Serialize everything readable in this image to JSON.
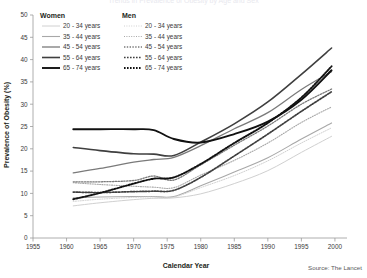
{
  "figure": {
    "cut_title": "Trends in Prevalence of Obesity by Age and Sex",
    "source_note": "Source: The Lancet"
  },
  "axes": {
    "xlabel": "Calendar Year",
    "ylabel": "Prevalence of Obesity (%)",
    "xticks": [
      1955,
      1960,
      1965,
      1970,
      1975,
      1980,
      1985,
      1990,
      1995,
      2000
    ],
    "yticks": [
      0,
      5,
      10,
      15,
      20,
      25,
      30,
      35,
      40,
      45,
      50
    ],
    "xlim": [
      1955,
      2001.5
    ],
    "ylim": [
      0,
      50
    ],
    "grid": false
  },
  "legend": {
    "position": "top-left-inside",
    "groups": [
      {
        "title": "Women",
        "entries": [
          {
            "label": "20 - 34 years",
            "color": "#d0d0d0",
            "width": 1.0,
            "dash": "none"
          },
          {
            "label": "35 - 44 years",
            "color": "#a8a8a8",
            "width": 1.1,
            "dash": "none"
          },
          {
            "label": "45 - 54 years",
            "color": "#7a7a7a",
            "width": 1.3,
            "dash": "none"
          },
          {
            "label": "55 - 64 years",
            "color": "#3f3f3f",
            "width": 1.6,
            "dash": "none"
          },
          {
            "label": "65 - 74 years",
            "color": "#111111",
            "width": 1.9,
            "dash": "none"
          }
        ]
      },
      {
        "title": "Men",
        "entries": [
          {
            "label": "20 - 34 years",
            "color": "#d0d0d0",
            "width": 1.0,
            "dash": "1,1.4"
          },
          {
            "label": "35 - 44 years",
            "color": "#a8a8a8",
            "width": 1.1,
            "dash": "1,1.4"
          },
          {
            "label": "45 - 54 years",
            "color": "#7a7a7a",
            "width": 1.3,
            "dash": "1.4,1.4"
          },
          {
            "label": "55 - 64 years",
            "color": "#3f3f3f",
            "width": 1.7,
            "dash": "1.6,1.4"
          },
          {
            "label": "65 - 74 years",
            "color": "#111111",
            "width": 1.9,
            "dash": "1.6,1.4"
          }
        ]
      }
    ]
  },
  "chart_data": {
    "type": "line",
    "title": "Trends in Prevalence of Obesity by Age and Sex",
    "xlabel": "Calendar Year",
    "ylabel": "Prevalence of Obesity (%)",
    "xlim": [
      1955,
      2001.5
    ],
    "ylim": [
      0,
      50
    ],
    "x": [
      1961,
      1965,
      1970,
      1973,
      1976,
      1980,
      1985,
      1990,
      1995,
      1999.5
    ],
    "series": [
      {
        "name": "Women 20 - 34 years",
        "sex": "Women",
        "age_group": "20 - 34 years",
        "color": "#d0d0d0",
        "dash": "none",
        "width": 1.0,
        "values": [
          7.2,
          7.9,
          8.6,
          8.9,
          9.0,
          9.9,
          12.2,
          15.1,
          19.2,
          22.8
        ]
      },
      {
        "name": "Women 35 - 44 years",
        "sex": "Women",
        "age_group": "35 - 44 years",
        "color": "#a8a8a8",
        "dash": "none",
        "width": 1.1,
        "values": [
          9.0,
          9.2,
          9.3,
          9.3,
          9.3,
          11.7,
          14.8,
          18.0,
          22.2,
          25.8
        ]
      },
      {
        "name": "Women 45 - 54 years",
        "sex": "Women",
        "age_group": "45 - 54 years",
        "color": "#7a7a7a",
        "dash": "none",
        "width": 1.3,
        "values": [
          14.6,
          15.6,
          17.0,
          17.6,
          18.1,
          20.7,
          24.5,
          28.1,
          33.3,
          37.3
        ]
      },
      {
        "name": "Women 55 - 64 years",
        "sex": "Women",
        "age_group": "55 - 64 years",
        "color": "#3f3f3f",
        "dash": "none",
        "width": 1.6,
        "values": [
          20.3,
          19.6,
          18.9,
          18.8,
          18.5,
          21.5,
          25.6,
          30.5,
          36.7,
          42.6
        ]
      },
      {
        "name": "Women 65 - 74 years",
        "sex": "Women",
        "age_group": "65 - 74 years",
        "color": "#111111",
        "dash": "none",
        "width": 1.9,
        "values": [
          24.4,
          24.4,
          24.4,
          24.2,
          22.2,
          21.4,
          23.3,
          26.1,
          31.0,
          37.6
        ]
      },
      {
        "name": "Men 20 - 34 years",
        "sex": "Men",
        "age_group": "20 - 34 years",
        "color": "#d0d0d0",
        "dash": "1,1.4",
        "width": 1.0,
        "values": [
          8.2,
          8.7,
          9.1,
          9.2,
          9.2,
          11.3,
          14.0,
          17.3,
          21.3,
          24.7
        ]
      },
      {
        "name": "Men 35 - 44 years",
        "sex": "Men",
        "age_group": "35 - 44 years",
        "color": "#a8a8a8",
        "dash": "1,1.4",
        "width": 1.1,
        "values": [
          12.4,
          12.0,
          11.6,
          11.4,
          11.3,
          14.1,
          17.4,
          21.3,
          25.9,
          29.4
        ]
      },
      {
        "name": "Men 45 - 54 years",
        "sex": "Men",
        "age_group": "45 - 54 years",
        "color": "#7a7a7a",
        "dash": "1.4,1.4",
        "width": 1.3,
        "values": [
          12.6,
          12.6,
          12.9,
          13.9,
          13.0,
          16.4,
          20.8,
          25.1,
          30.0,
          33.4
        ]
      },
      {
        "name": "Men 55 - 64 years",
        "sex": "Men",
        "age_group": "55 - 64 years",
        "color": "#3f3f3f",
        "dash": "1.6,1.4",
        "width": 1.7,
        "values": [
          10.3,
          10.2,
          10.4,
          10.5,
          10.7,
          13.6,
          18.4,
          23.3,
          28.4,
          32.8
        ]
      },
      {
        "name": "Men 65 - 74 years",
        "sex": "Men",
        "age_group": "65 - 74 years",
        "color": "#111111",
        "dash": "1.6,1.4",
        "width": 1.9,
        "values": [
          8.7,
          10.1,
          12.2,
          13.3,
          13.6,
          16.6,
          21.3,
          25.8,
          31.5,
          38.5
        ]
      }
    ]
  }
}
